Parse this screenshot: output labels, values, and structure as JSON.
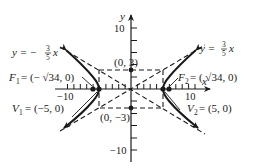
{
  "figure": {
    "axes": {
      "x_label": "x",
      "y_label": "y",
      "x_ticks": {
        "neg": "−10",
        "pos": "10"
      },
      "y_ticks": {
        "pos": "10",
        "neg": "−10"
      }
    },
    "asymptotes": {
      "left": {
        "prefix": "y = −",
        "num": "3",
        "den": "5",
        "var": "x"
      },
      "right": {
        "prefix": "y = ",
        "num": "3",
        "den": "5",
        "var": "x"
      }
    },
    "points": {
      "top": "(0, 3)",
      "bottom": "(0, −3)",
      "f1": {
        "name": "F",
        "sub": "1",
        "value": "= (− √34, 0)"
      },
      "f2": {
        "name": "F",
        "sub": "2",
        "value": "= ( √34, 0)"
      },
      "v1": {
        "name": "V",
        "sub": "1",
        "value": "= (−5, 0)"
      },
      "v2": {
        "name": "V",
        "sub": "2",
        "value": "= (5, 0)"
      }
    },
    "colors": {
      "ink": "#1a1a1a",
      "background": "#ffffff"
    }
  }
}
